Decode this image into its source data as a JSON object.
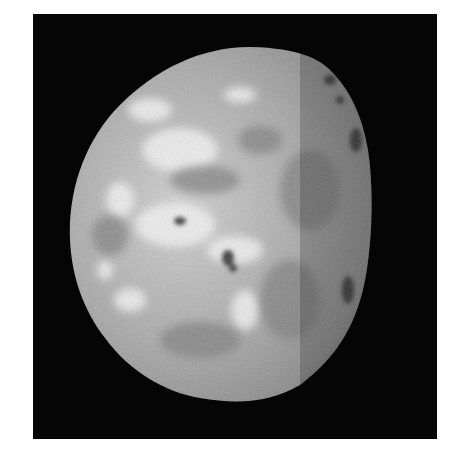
{
  "image": {
    "subject": "moon",
    "background_color": "#050505",
    "border_color": "#ffffff",
    "surface_base_color": "#9a9a9a",
    "highlight_color": "#eeeeee",
    "shadow_color": "#4a4a4a"
  }
}
